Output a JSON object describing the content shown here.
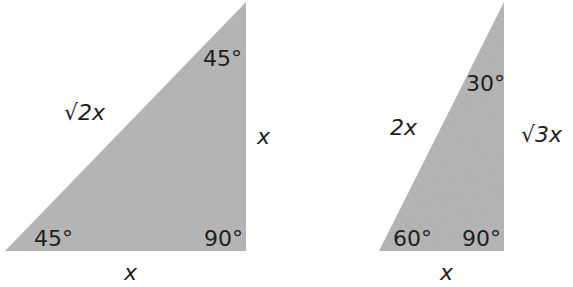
{
  "fill_color": "#b4b4b4",
  "triangles": [
    {
      "name": "45-45-90",
      "angles": {
        "top": "45°",
        "bottom_left": "45°",
        "right_angle": "90°"
      },
      "sides": {
        "hypotenuse": "√2x",
        "vertical": "x",
        "base": "x"
      }
    },
    {
      "name": "30-60-90",
      "angles": {
        "top": "30°",
        "bottom_left": "60°",
        "right_angle": "90°"
      },
      "sides": {
        "hypotenuse": "2x",
        "vertical": "√3x",
        "base": "x"
      }
    }
  ]
}
